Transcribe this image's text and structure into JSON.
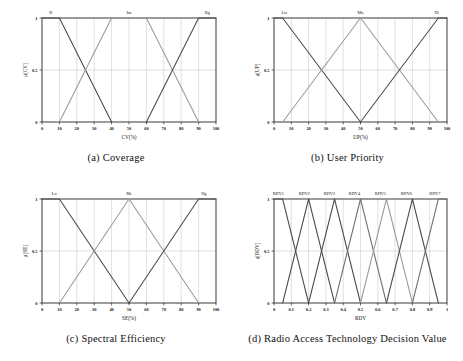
{
  "figure": {
    "background": "#ffffff",
    "line_colors": {
      "dark": "#4a4a4a",
      "mid": "#6f6f6f",
      "light": "#9a9a9a",
      "axis": "#222222",
      "grid": "#b9b9b9"
    }
  },
  "panels": [
    {
      "id": "a",
      "caption_number": "(a)",
      "caption_text": "Coverage",
      "chart_data": {
        "type": "line",
        "title": "Coverage",
        "xlabel": "CV(%)",
        "ylabel": "μ[CV]",
        "xlim": [
          0,
          100
        ],
        "ylim": [
          0,
          1
        ],
        "xticks": [
          0,
          10,
          20,
          30,
          40,
          50,
          60,
          70,
          80,
          90,
          100
        ],
        "yticks": [
          0,
          0.5,
          1
        ],
        "grid": true,
        "legend_position": "inside-top",
        "series": [
          {
            "name": "Sl",
            "label_x": 5,
            "color": "#4a4a4a",
            "points": [
              [
                0,
                1
              ],
              [
                10,
                1
              ],
              [
                40,
                0
              ]
            ]
          },
          {
            "name": "Im",
            "label_x": 50,
            "color": "#9a9a9a",
            "points": [
              [
                10,
                0
              ],
              [
                40,
                1
              ],
              [
                60,
                1
              ],
              [
                90,
                0
              ]
            ]
          },
          {
            "name": "Bg",
            "label_x": 95,
            "color": "#4a4a4a",
            "points": [
              [
                60,
                0
              ],
              [
                90,
                1
              ],
              [
                100,
                1
              ]
            ]
          }
        ]
      }
    },
    {
      "id": "b",
      "caption_number": "(b)",
      "caption_text": "User Priority",
      "chart_data": {
        "type": "line",
        "title": "User Priority",
        "xlabel": "UP(%)",
        "ylabel": "μ[UP]",
        "xlim": [
          0,
          100
        ],
        "ylim": [
          0,
          1
        ],
        "xticks": [
          0,
          10,
          20,
          30,
          40,
          50,
          60,
          70,
          80,
          90,
          100
        ],
        "yticks": [
          0,
          0.5,
          1
        ],
        "grid": true,
        "legend_position": "inside-top",
        "series": [
          {
            "name": "Lw",
            "label_x": 6,
            "color": "#4a4a4a",
            "points": [
              [
                0,
                1
              ],
              [
                5,
                1
              ],
              [
                50,
                0
              ]
            ]
          },
          {
            "name": "Mu",
            "label_x": 50,
            "color": "#9a9a9a",
            "points": [
              [
                5,
                0
              ],
              [
                50,
                1
              ],
              [
                95,
                0
              ]
            ]
          },
          {
            "name": "Hi",
            "label_x": 94,
            "color": "#4a4a4a",
            "points": [
              [
                50,
                0
              ],
              [
                95,
                1
              ],
              [
                100,
                1
              ]
            ]
          }
        ]
      }
    },
    {
      "id": "c",
      "caption_number": "(c)",
      "caption_text": "Spectral Efficiency",
      "chart_data": {
        "type": "line",
        "title": "Spectral Efficiency",
        "xlabel": "SE(%)",
        "ylabel": "μ[SE]",
        "xlim": [
          0,
          100
        ],
        "ylim": [
          0,
          1
        ],
        "xticks": [
          0,
          10,
          20,
          30,
          40,
          50,
          60,
          70,
          80,
          90,
          100
        ],
        "yticks": [
          0,
          0.5,
          1
        ],
        "grid": true,
        "legend_position": "inside-top",
        "series": [
          {
            "name": "Lo",
            "label_x": 7,
            "color": "#4a4a4a",
            "points": [
              [
                0,
                1
              ],
              [
                10,
                1
              ],
              [
                50,
                0
              ]
            ]
          },
          {
            "name": "Me",
            "label_x": 50,
            "color": "#9a9a9a",
            "points": [
              [
                10,
                0
              ],
              [
                50,
                1
              ],
              [
                90,
                0
              ]
            ]
          },
          {
            "name": "Hg",
            "label_x": 93,
            "color": "#4a4a4a",
            "points": [
              [
                50,
                0
              ],
              [
                90,
                1
              ],
              [
                100,
                1
              ]
            ]
          }
        ]
      }
    },
    {
      "id": "d",
      "caption_number": "(d)",
      "caption_text": "Radio Access Technology Decision Value",
      "chart_data": {
        "type": "line",
        "title": "Radio Access Technology Decision Value",
        "xlabel": "RDV",
        "ylabel": "μ[RDV]",
        "xlim": [
          0,
          1
        ],
        "ylim": [
          0,
          1
        ],
        "xticks": [
          0,
          0.1,
          0.2,
          0.3,
          0.4,
          0.5,
          0.6,
          0.7,
          0.8,
          0.9,
          1
        ],
        "yticks": [
          0,
          0.5,
          1
        ],
        "grid": true,
        "legend_position": "inside-top",
        "series": [
          {
            "name": "RDV1",
            "label_x": 0.025,
            "color": "#4a4a4a",
            "points": [
              [
                0,
                1
              ],
              [
                0.05,
                1
              ],
              [
                0.2,
                0
              ]
            ]
          },
          {
            "name": "RDV2",
            "label_x": 0.175,
            "color": "#4a4a4a",
            "points": [
              [
                0.05,
                0
              ],
              [
                0.2,
                1
              ],
              [
                0.35,
                0
              ]
            ]
          },
          {
            "name": "RDV3",
            "label_x": 0.32,
            "color": "#4a4a4a",
            "points": [
              [
                0.2,
                0
              ],
              [
                0.35,
                1
              ],
              [
                0.5,
                0
              ]
            ]
          },
          {
            "name": "RDV4",
            "label_x": 0.465,
            "color": "#6f6f6f",
            "points": [
              [
                0.35,
                0
              ],
              [
                0.5,
                1
              ],
              [
                0.65,
                0
              ]
            ]
          },
          {
            "name": "RDV5",
            "label_x": 0.615,
            "color": "#9a9a9a",
            "points": [
              [
                0.5,
                0
              ],
              [
                0.65,
                1
              ],
              [
                0.8,
                0
              ]
            ]
          },
          {
            "name": "RDV6",
            "label_x": 0.765,
            "color": "#4a4a4a",
            "points": [
              [
                0.65,
                0
              ],
              [
                0.8,
                1
              ],
              [
                0.95,
                0
              ]
            ]
          },
          {
            "name": "RDV7",
            "label_x": 0.93,
            "color": "#6f6f6f",
            "points": [
              [
                0.8,
                0
              ],
              [
                0.95,
                1
              ],
              [
                1,
                1
              ]
            ]
          }
        ]
      }
    }
  ]
}
